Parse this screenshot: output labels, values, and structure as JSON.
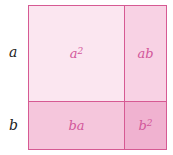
{
  "diagram": {
    "side_labels": [
      "a",
      "b"
    ],
    "cells": [
      {
        "id": "a2",
        "base": "a",
        "exp": "2"
      },
      {
        "id": "ab",
        "text": "ab"
      },
      {
        "id": "ba",
        "text": "ba"
      },
      {
        "id": "b2",
        "base": "b",
        "exp": "2"
      }
    ],
    "colors": {
      "border": "#d65a93",
      "text": "#d2579a",
      "a2_fill": "#fbe6f0",
      "ab_fill": "#f8d2e4",
      "ba_fill": "#f5c6dc",
      "b2_fill": "#f0b2d0"
    }
  }
}
